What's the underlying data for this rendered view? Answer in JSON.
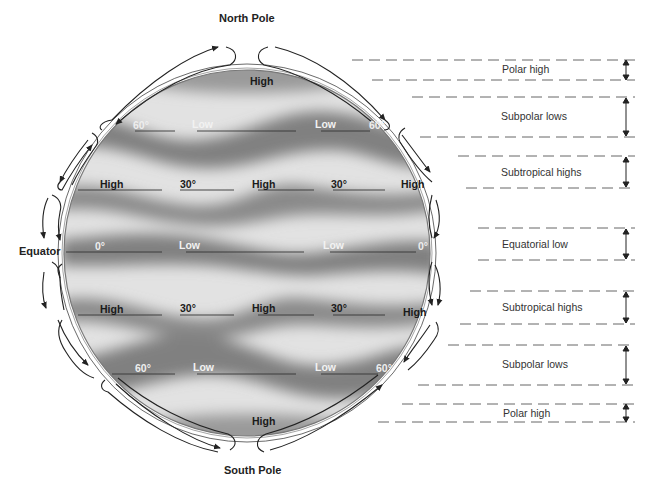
{
  "diagram": {
    "poles": {
      "north": "North Pole",
      "south": "South Pole"
    },
    "equator_label": "Equator",
    "globe_labels": {
      "north_polar_high": "High",
      "south_polar_high": "High",
      "n60_deg": "60°",
      "n60_low_1": "Low",
      "n60_low_2": "Low",
      "n60_deg_right": "60°",
      "n30_high_1": "High",
      "n30_deg": "30°",
      "n30_high_2": "High",
      "n30_deg_2": "30°",
      "n30_high_3": "High",
      "eq_deg": "0°",
      "eq_low_1": "Low",
      "eq_low_2": "Low",
      "eq_deg_right": "0°",
      "s30_high_1": "High",
      "s30_deg": "30°",
      "s30_high_2": "High",
      "s30_deg_2": "30°",
      "s30_high_3": "High",
      "s60_deg": "60°",
      "s60_low_1": "Low",
      "s60_low_2": "Low",
      "s60_deg_right": "60°"
    },
    "pressure_zones": [
      {
        "label": "Polar high"
      },
      {
        "label": "Subpolar lows"
      },
      {
        "label": "Subtropical highs"
      },
      {
        "label": "Equatorial low"
      },
      {
        "label": "Subtropical highs"
      },
      {
        "label": "Subpolar lows"
      },
      {
        "label": "Polar high"
      }
    ],
    "colors": {
      "globe_light": "#e4e4e4",
      "globe_dark": "#7d7d7d",
      "arrow": "#222222",
      "dash": "#555555"
    }
  }
}
